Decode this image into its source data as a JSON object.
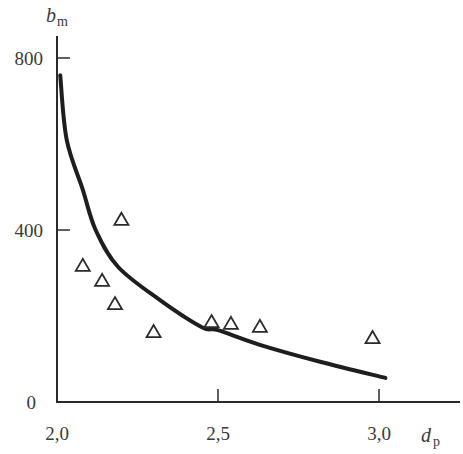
{
  "chart_data": {
    "type": "scatter",
    "title": "",
    "xlabel": "d",
    "xlabel_sub": "p",
    "ylabel": "b",
    "ylabel_sub": "m",
    "xlim": [
      2.0,
      3.0
    ],
    "ylim": [
      0,
      800
    ],
    "x_ticks": [
      "2,0",
      "2,5",
      "3,0"
    ],
    "x_tick_values": [
      2.0,
      2.5,
      3.0
    ],
    "y_ticks": [
      "0",
      "400",
      "800"
    ],
    "y_tick_values": [
      0,
      400,
      800
    ],
    "grid": false,
    "legend": null,
    "series": [
      {
        "name": "measured",
        "type": "scatter",
        "marker": "open-triangle",
        "x": [
          2.08,
          2.14,
          2.18,
          2.2,
          2.3,
          2.48,
          2.54,
          2.63,
          2.98
        ],
        "y": [
          319,
          284,
          230,
          426,
          165,
          188,
          184,
          177,
          151
        ]
      },
      {
        "name": "fitted curve",
        "type": "line",
        "x": [
          2.01,
          2.03,
          2.08,
          2.12,
          2.19,
          2.32,
          2.45,
          2.5,
          2.63,
          2.82,
          3.02
        ],
        "y": [
          760,
          610,
          494,
          400,
          314,
          237,
          174,
          167,
          133,
          93,
          56
        ]
      }
    ]
  }
}
